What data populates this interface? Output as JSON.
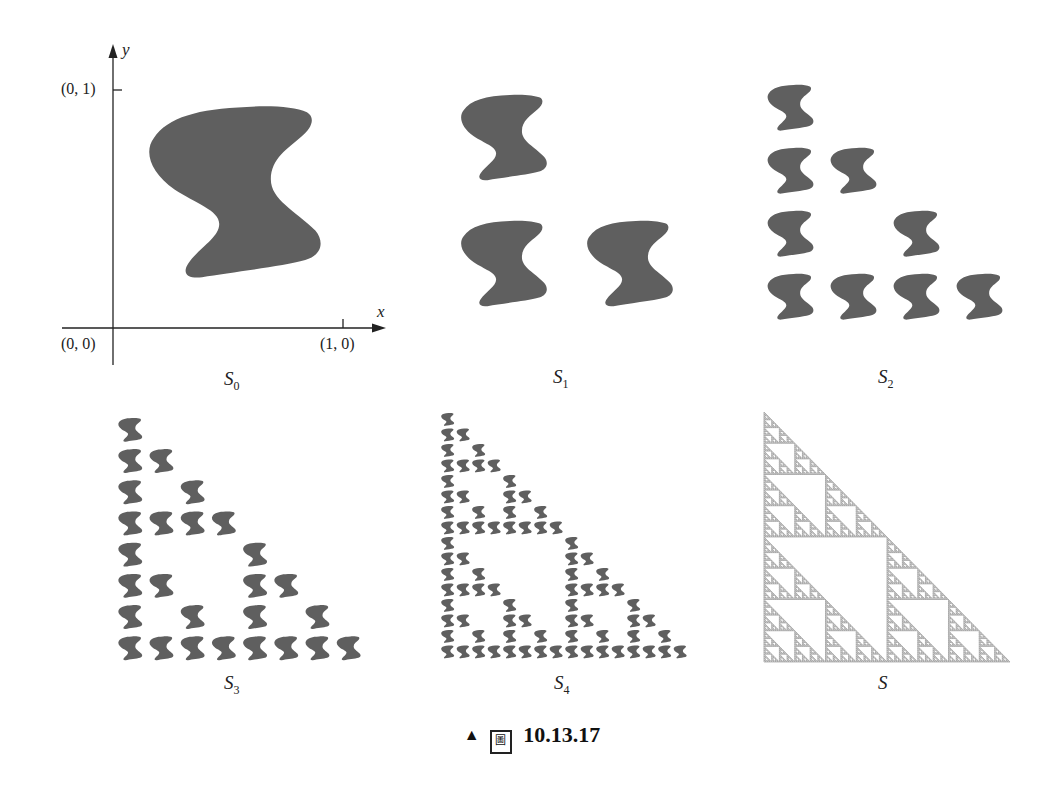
{
  "figure": {
    "caption_marker": "▲",
    "caption_fig_char": "圖",
    "caption_number": "10.13.17",
    "shape_color": "#5f5f5f",
    "fractal_color": "#9a9a9a",
    "axis_color": "#222222"
  },
  "panels": [
    {
      "id": "S0",
      "label_main": "S",
      "label_sub": "0",
      "label_x": 224,
      "label_y": 368,
      "level": 0,
      "origin": [
        147,
        107
      ],
      "size": 172,
      "step": 172
    },
    {
      "id": "S1",
      "label_main": "S",
      "label_sub": "1",
      "label_x": 553,
      "label_y": 366,
      "level": 1,
      "origin": [
        460,
        95
      ],
      "size": 86,
      "step": 126
    },
    {
      "id": "S2",
      "label_main": "S",
      "label_sub": "2",
      "label_x": 878,
      "label_y": 366,
      "level": 2,
      "origin": [
        767,
        85
      ],
      "size": 46,
      "step": 63
    },
    {
      "id": "S3",
      "label_main": "S",
      "label_sub": "3",
      "label_x": 224,
      "label_y": 672,
      "level": 3,
      "origin": [
        118,
        418
      ],
      "size": 24,
      "step": 31.2
    },
    {
      "id": "S4",
      "label_main": "S",
      "label_sub": "4",
      "label_x": 554,
      "label_y": 672,
      "level": 4,
      "origin": [
        441,
        413
      ],
      "size": 13,
      "step": 15.5
    },
    {
      "id": "S",
      "label_main": "S",
      "label_sub": "",
      "label_x": 878,
      "label_y": 672,
      "level": "limit",
      "triangle": {
        "apex": [
          764,
          412
        ],
        "bottom_left": [
          764,
          662
        ],
        "bottom_right": [
          1010,
          662
        ]
      },
      "depth": 7
    }
  ],
  "axes": {
    "y_label": "y",
    "x_label": "x",
    "tick_y_label": "(0, 1)",
    "tick_x_label": "(1, 0)",
    "origin_label": "(0, 0)"
  }
}
